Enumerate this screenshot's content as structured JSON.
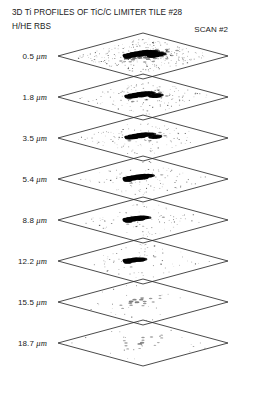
{
  "figure": {
    "title": "3D Ti PROFILES OF TiC/C LIMITER TILE #28",
    "subtitle": "H/HE RBS",
    "scan_label": "SCAN #2"
  },
  "chart_data": {
    "type": "scatter",
    "title": "3D Ti PROFILES OF TiC/C LIMITER TILE #28",
    "subtitle": "H/HE RBS",
    "annotation": "SCAN #2",
    "xlabel": "",
    "ylabel": "",
    "zlabel": "depth",
    "depth_unit": "μm",
    "legend": [],
    "grid": false,
    "plane_outline_color": "#2b2b2b",
    "marker_color": "#000000",
    "background_color": "#ffffff",
    "layers": [
      {
        "depth": 0.5,
        "label": "0.5",
        "unit": "μm",
        "density": "very high",
        "coverage_percent": 9.0,
        "cluster": "broad dense streak with diffuse halo and secondary blob",
        "points": [
          [
            0.42,
            0.4,
            1.0
          ],
          [
            0.46,
            0.4,
            1.0
          ],
          [
            0.5,
            0.4,
            1.0
          ],
          [
            0.54,
            0.41,
            1.0
          ],
          [
            0.58,
            0.42,
            1.0
          ],
          [
            0.62,
            0.43,
            1.0
          ],
          [
            0.44,
            0.43,
            1.0
          ],
          [
            0.48,
            0.43,
            1.0
          ],
          [
            0.52,
            0.43,
            1.0
          ],
          [
            0.56,
            0.44,
            1.0
          ],
          [
            0.6,
            0.45,
            1.0
          ],
          [
            0.64,
            0.46,
            1.0
          ],
          [
            0.4,
            0.42,
            0.9
          ],
          [
            0.38,
            0.44,
            0.7
          ],
          [
            0.66,
            0.47,
            0.8
          ],
          [
            0.68,
            0.48,
            0.6
          ],
          [
            0.5,
            0.46,
            0.9
          ],
          [
            0.54,
            0.47,
            0.9
          ],
          [
            0.58,
            0.48,
            0.8
          ],
          [
            0.56,
            0.54,
            1.0
          ],
          [
            0.6,
            0.54,
            1.0
          ],
          [
            0.64,
            0.55,
            1.0
          ],
          [
            0.58,
            0.56,
            1.0
          ],
          [
            0.62,
            0.56,
            1.0
          ],
          [
            0.66,
            0.56,
            0.9
          ],
          [
            0.54,
            0.56,
            0.8
          ],
          [
            0.44,
            0.52,
            0.4
          ],
          [
            0.48,
            0.55,
            0.4
          ],
          [
            0.4,
            0.5,
            0.35
          ],
          [
            0.36,
            0.52,
            0.3
          ],
          [
            0.7,
            0.52,
            0.3
          ],
          [
            0.74,
            0.55,
            0.3
          ],
          [
            0.46,
            0.6,
            0.3
          ],
          [
            0.52,
            0.62,
            0.3
          ],
          [
            0.6,
            0.62,
            0.3
          ],
          [
            0.66,
            0.6,
            0.3
          ],
          [
            0.34,
            0.46,
            0.3
          ],
          [
            0.78,
            0.5,
            0.25
          ],
          [
            0.3,
            0.55,
            0.2
          ],
          [
            0.82,
            0.58,
            0.2
          ],
          [
            0.44,
            0.68,
            0.2
          ],
          [
            0.58,
            0.7,
            0.2
          ],
          [
            0.26,
            0.48,
            0.2
          ],
          [
            0.72,
            0.44,
            0.25
          ],
          [
            0.68,
            0.66,
            0.2
          ],
          [
            0.38,
            0.64,
            0.2
          ]
        ]
      },
      {
        "depth": 1.8,
        "label": "1.8",
        "unit": "μm",
        "density": "high",
        "coverage_percent": 4.5,
        "cluster": "compact dark streak with small satellite blob below-right",
        "points": [
          [
            0.44,
            0.4,
            1.0
          ],
          [
            0.48,
            0.4,
            1.0
          ],
          [
            0.52,
            0.41,
            1.0
          ],
          [
            0.56,
            0.42,
            1.0
          ],
          [
            0.6,
            0.43,
            1.0
          ],
          [
            0.46,
            0.43,
            1.0
          ],
          [
            0.5,
            0.43,
            1.0
          ],
          [
            0.54,
            0.44,
            1.0
          ],
          [
            0.58,
            0.45,
            1.0
          ],
          [
            0.62,
            0.45,
            1.0
          ],
          [
            0.42,
            0.42,
            0.9
          ],
          [
            0.64,
            0.46,
            0.8
          ],
          [
            0.52,
            0.46,
            0.9
          ],
          [
            0.56,
            0.47,
            0.85
          ],
          [
            0.58,
            0.54,
            1.0
          ],
          [
            0.62,
            0.54,
            1.0
          ],
          [
            0.6,
            0.56,
            0.95
          ],
          [
            0.64,
            0.55,
            0.85
          ],
          [
            0.38,
            0.46,
            0.3
          ],
          [
            0.7,
            0.5,
            0.25
          ],
          [
            0.46,
            0.58,
            0.25
          ],
          [
            0.74,
            0.44,
            0.2
          ],
          [
            0.34,
            0.54,
            0.2
          ],
          [
            0.66,
            0.62,
            0.2
          ]
        ]
      },
      {
        "depth": 3.5,
        "label": "3.5",
        "unit": "μm",
        "density": "high",
        "coverage_percent": 4.0,
        "cluster": "dark streak slightly narrower, small blob below",
        "points": [
          [
            0.44,
            0.4,
            1.0
          ],
          [
            0.48,
            0.4,
            1.0
          ],
          [
            0.52,
            0.41,
            1.0
          ],
          [
            0.56,
            0.42,
            1.0
          ],
          [
            0.6,
            0.43,
            1.0
          ],
          [
            0.46,
            0.43,
            1.0
          ],
          [
            0.5,
            0.43,
            1.0
          ],
          [
            0.54,
            0.44,
            1.0
          ],
          [
            0.58,
            0.45,
            1.0
          ],
          [
            0.62,
            0.46,
            0.9
          ],
          [
            0.42,
            0.42,
            0.85
          ],
          [
            0.64,
            0.47,
            0.7
          ],
          [
            0.52,
            0.46,
            0.85
          ],
          [
            0.58,
            0.54,
            0.95
          ],
          [
            0.62,
            0.55,
            0.9
          ],
          [
            0.6,
            0.56,
            0.8
          ],
          [
            0.36,
            0.48,
            0.25
          ],
          [
            0.72,
            0.48,
            0.2
          ],
          [
            0.48,
            0.6,
            0.2
          ],
          [
            0.68,
            0.58,
            0.2
          ]
        ]
      },
      {
        "depth": 5.4,
        "label": "5.4",
        "unit": "μm",
        "density": "high",
        "coverage_percent": 3.2,
        "cluster": "thick solid elongated blob, no satellite",
        "points": [
          [
            0.42,
            0.4,
            1.0
          ],
          [
            0.46,
            0.4,
            1.0
          ],
          [
            0.5,
            0.41,
            1.0
          ],
          [
            0.54,
            0.42,
            1.0
          ],
          [
            0.58,
            0.44,
            1.0
          ],
          [
            0.44,
            0.43,
            1.0
          ],
          [
            0.48,
            0.43,
            1.0
          ],
          [
            0.52,
            0.44,
            1.0
          ],
          [
            0.56,
            0.45,
            1.0
          ],
          [
            0.6,
            0.46,
            1.0
          ],
          [
            0.4,
            0.42,
            0.95
          ],
          [
            0.5,
            0.46,
            1.0
          ],
          [
            0.54,
            0.47,
            0.95
          ],
          [
            0.62,
            0.47,
            0.8
          ],
          [
            0.38,
            0.44,
            0.8
          ],
          [
            0.7,
            0.52,
            0.18
          ],
          [
            0.34,
            0.52,
            0.18
          ]
        ]
      },
      {
        "depth": 8.8,
        "label": "8.8",
        "unit": "μm",
        "density": "medium-high",
        "coverage_percent": 2.8,
        "cluster": "solid elongated blob, slightly shorter",
        "points": [
          [
            0.42,
            0.4,
            1.0
          ],
          [
            0.46,
            0.4,
            1.0
          ],
          [
            0.5,
            0.41,
            1.0
          ],
          [
            0.54,
            0.43,
            1.0
          ],
          [
            0.44,
            0.43,
            1.0
          ],
          [
            0.48,
            0.43,
            1.0
          ],
          [
            0.52,
            0.45,
            1.0
          ],
          [
            0.56,
            0.45,
            1.0
          ],
          [
            0.4,
            0.42,
            0.95
          ],
          [
            0.5,
            0.46,
            0.95
          ],
          [
            0.58,
            0.47,
            0.75
          ],
          [
            0.38,
            0.45,
            0.7
          ],
          [
            0.68,
            0.56,
            0.15
          ],
          [
            0.32,
            0.5,
            0.15
          ]
        ]
      },
      {
        "depth": 12.2,
        "label": "12.2",
        "unit": "μm",
        "density": "medium",
        "coverage_percent": 2.2,
        "cluster": "shorter solid blob, markedly reduced",
        "points": [
          [
            0.42,
            0.4,
            1.0
          ],
          [
            0.46,
            0.41,
            1.0
          ],
          [
            0.5,
            0.42,
            1.0
          ],
          [
            0.44,
            0.43,
            1.0
          ],
          [
            0.48,
            0.44,
            1.0
          ],
          [
            0.52,
            0.45,
            1.0
          ],
          [
            0.4,
            0.42,
            0.9
          ],
          [
            0.54,
            0.46,
            0.8
          ],
          [
            0.38,
            0.44,
            0.7
          ],
          [
            0.5,
            0.47,
            0.75
          ],
          [
            0.66,
            0.48,
            0.15
          ],
          [
            0.3,
            0.56,
            0.12
          ]
        ]
      },
      {
        "depth": 15.5,
        "label": "15.5",
        "unit": "μm",
        "density": "very low",
        "coverage_percent": 0.5,
        "cluster": "faint scattered speckle only, deposit essentially gone",
        "points": [
          [
            0.44,
            0.42,
            0.35
          ],
          [
            0.5,
            0.4,
            0.3
          ],
          [
            0.54,
            0.44,
            0.3
          ],
          [
            0.46,
            0.47,
            0.35
          ],
          [
            0.4,
            0.45,
            0.25
          ],
          [
            0.58,
            0.41,
            0.25
          ],
          [
            0.52,
            0.5,
            0.25
          ],
          [
            0.36,
            0.5,
            0.2
          ],
          [
            0.62,
            0.47,
            0.2
          ],
          [
            0.48,
            0.54,
            0.2
          ],
          [
            0.3,
            0.44,
            0.15
          ],
          [
            0.68,
            0.52,
            0.15
          ],
          [
            0.56,
            0.56,
            0.15
          ],
          [
            0.42,
            0.58,
            0.15
          ],
          [
            0.74,
            0.46,
            0.12
          ],
          [
            0.24,
            0.52,
            0.12
          ]
        ]
      },
      {
        "depth": 18.7,
        "label": "18.7",
        "unit": "μm",
        "density": "negligible",
        "coverage_percent": 0.3,
        "cluster": "isolated specks, near-zero titanium signal",
        "points": [
          [
            0.46,
            0.5,
            0.3
          ],
          [
            0.5,
            0.49,
            0.3
          ],
          [
            0.4,
            0.4,
            0.2
          ],
          [
            0.62,
            0.38,
            0.2
          ],
          [
            0.68,
            0.42,
            0.18
          ],
          [
            0.34,
            0.46,
            0.15
          ],
          [
            0.56,
            0.44,
            0.15
          ],
          [
            0.72,
            0.5,
            0.15
          ],
          [
            0.28,
            0.54,
            0.12
          ],
          [
            0.6,
            0.58,
            0.12
          ],
          [
            0.44,
            0.34,
            0.12
          ],
          [
            0.78,
            0.44,
            0.1
          ],
          [
            0.52,
            0.62,
            0.1
          ],
          [
            0.36,
            0.6,
            0.1
          ]
        ]
      }
    ]
  }
}
